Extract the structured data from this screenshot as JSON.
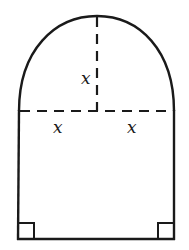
{
  "diagram": {
    "labels": {
      "radius_vertical": "x",
      "radius_left": "x",
      "radius_right": "x"
    },
    "colors": {
      "stroke": "#1a1a1a",
      "background": "#ffffff"
    },
    "shapes": {
      "semicircle": "top arc with radius x",
      "rectangle": "bottom rectangle of width 2x",
      "right_angles": 2
    }
  }
}
